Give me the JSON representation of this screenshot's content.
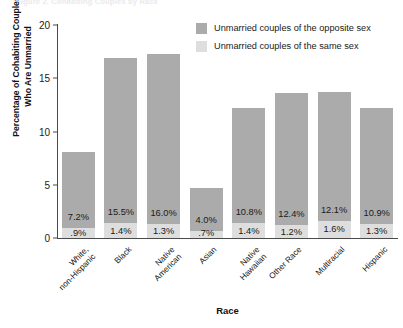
{
  "chart_data": {
    "type": "bar",
    "subtype": "stacked",
    "title": "Figure 2. Cohabiting Couples by Race",
    "xlabel": "Race",
    "ylabel": "Percentage of Cohabiting Couples\nWho Are Unmarried",
    "ylim": [
      0,
      20
    ],
    "yticks": [
      0,
      5,
      10,
      15,
      20
    ],
    "ytick_labels": [
      "0",
      "5",
      "10",
      "15",
      "20"
    ],
    "grid": false,
    "legend_position": "top-right",
    "categories": [
      "White,\nnon-Hispanic",
      "Black",
      "Native\nAmerican",
      "Asian",
      "Native\nHawaiian",
      "Other Race",
      "Multiracial",
      "Hispanic"
    ],
    "series": [
      {
        "name": "Unmarried couples of the opposite sex",
        "color": "#ababab",
        "values": [
          7.2,
          15.5,
          16.0,
          4.0,
          10.8,
          12.4,
          12.1,
          10.9
        ],
        "labels": [
          "7.2%",
          "15.5%",
          "16.0%",
          "4.0%",
          "10.8%",
          "12.4%",
          "12.1%",
          "10.9%"
        ]
      },
      {
        "name": "Unmarried couples of the same sex",
        "color": "#dedede",
        "values": [
          0.9,
          1.4,
          1.3,
          0.7,
          1.4,
          1.2,
          1.6,
          1.3
        ],
        "labels": [
          ".9%",
          "1.4%",
          "1.3%",
          ".7%",
          "1.4%",
          "1.2%",
          "1.6%",
          "1.3%"
        ]
      }
    ]
  },
  "legend": {
    "items": [
      {
        "label": "Unmarried couples of the opposite sex",
        "swatch": "dark"
      },
      {
        "label": "Unmarried couples of the same sex",
        "swatch": "light"
      }
    ]
  }
}
